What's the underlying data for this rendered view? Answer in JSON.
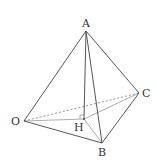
{
  "diagram": {
    "type": "tetrahedron",
    "colors": {
      "edge": "#444444",
      "hidden_edge": "#777777",
      "foot_lines": "#888888",
      "label": "#333333"
    },
    "points": {
      "A": {
        "label": "A",
        "x": 86,
        "y": 31
      },
      "O": {
        "label": "O",
        "x": 24,
        "y": 121
      },
      "B": {
        "label": "B",
        "x": 102,
        "y": 143
      },
      "C": {
        "label": "C",
        "x": 139,
        "y": 93
      },
      "H": {
        "label": "H",
        "x": 84,
        "y": 119
      }
    },
    "edges_solid": [
      "AO",
      "AB",
      "AC",
      "OB",
      "BC",
      "AH"
    ],
    "edges_dashed": [
      "OC"
    ],
    "edges_auxiliary": [
      "OH",
      "HB",
      "HC"
    ],
    "right_angle_marker_at": "H"
  }
}
